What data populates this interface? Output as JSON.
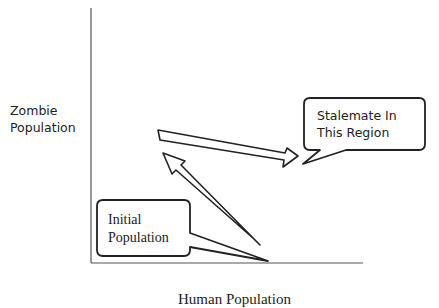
{
  "diagram": {
    "y_axis_label_line1": "Zombie",
    "y_axis_label_line2": "Population",
    "x_axis_label": "Human Population",
    "callout_stalemate_line1": "Stalemate In",
    "callout_stalemate_line2": "This Region",
    "callout_initial_line1": "Initial",
    "callout_initial_line2": "Population",
    "colors": {
      "axis": "#555555",
      "stroke": "#222222",
      "background": "#ffffff"
    }
  }
}
